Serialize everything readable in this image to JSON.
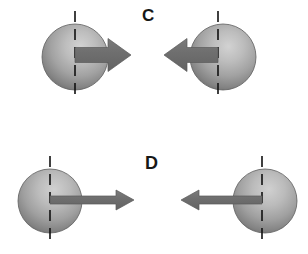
{
  "figure": {
    "width": 308,
    "height": 254,
    "background_color": "#ffffff"
  },
  "panels": [
    {
      "id": "panel-c",
      "label": "C",
      "label_x": 148,
      "label_y": 16,
      "items": [
        {
          "id": "c-left",
          "role": "sphere-with-spin-arrow",
          "sphere": {
            "cx": 75,
            "cy": 57,
            "r": 33
          },
          "axis": {
            "x": 75,
            "y1": 11,
            "y2": 101,
            "style": "dashed",
            "color": "#111111"
          },
          "arrow": {
            "direction": "right",
            "tail_x": 75,
            "tip_x": 131,
            "cy": 55,
            "shaft_thickness": 15,
            "head_length": 23,
            "head_width": 33,
            "color": "#6e6e6e"
          }
        },
        {
          "id": "c-right",
          "role": "sphere-with-spin-arrow",
          "sphere": {
            "cx": 223,
            "cy": 57,
            "r": 33
          },
          "axis": {
            "x": 218,
            "y1": 11,
            "y2": 101,
            "style": "dashed",
            "color": "#111111"
          },
          "arrow": {
            "direction": "left",
            "tail_x": 218,
            "tip_x": 164,
            "cy": 55,
            "shaft_thickness": 15,
            "head_length": 23,
            "head_width": 33,
            "color": "#6e6e6e"
          }
        }
      ]
    },
    {
      "id": "panel-d",
      "label": "D",
      "label_x": 152,
      "label_y": 163,
      "items": [
        {
          "id": "d-left",
          "role": "sphere-with-spin-arrow",
          "sphere": {
            "cx": 50,
            "cy": 201,
            "r": 32
          },
          "axis": {
            "x": 50,
            "y1": 156,
            "y2": 245,
            "style": "dashed",
            "color": "#111111"
          },
          "arrow": {
            "direction": "right",
            "tail_x": 50,
            "tip_x": 134,
            "cy": 200,
            "shaft_thickness": 8,
            "head_length": 18,
            "head_width": 20,
            "color": "#6e6e6e"
          }
        },
        {
          "id": "d-right",
          "role": "sphere-with-spin-arrow",
          "sphere": {
            "cx": 265,
            "cy": 201,
            "r": 32
          },
          "axis": {
            "x": 262,
            "y1": 156,
            "y2": 245,
            "style": "dashed",
            "color": "#111111"
          },
          "arrow": {
            "direction": "left",
            "tail_x": 262,
            "tip_x": 181,
            "cy": 200,
            "shaft_thickness": 8,
            "head_length": 18,
            "head_width": 20,
            "color": "#6e6e6e"
          }
        }
      ]
    }
  ],
  "style": {
    "sphere_highlight_color": "#c9c9c9",
    "sphere_mid_color": "#9b9b9b",
    "sphere_edge_color": "#6a6a6a",
    "sphere_outline_color": "#5e5e5e",
    "arrow_color": "#6e6e6e",
    "arrow_outline_color": "#5a5a5a",
    "axis_color": "#111111",
    "label_color": "#171717"
  }
}
